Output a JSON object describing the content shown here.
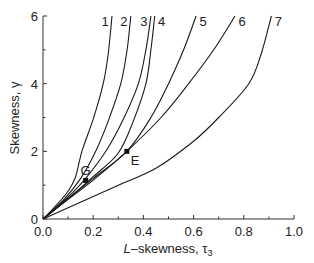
{
  "chart_data": {
    "type": "line",
    "title": "",
    "xlabel": "L-skewness, τ3",
    "xlabel_italic_prefix": "L",
    "xlabel_rest": "–skewness, τ",
    "xlabel_sub": "3",
    "ylabel": "Skewness, γ",
    "xlim": [
      0.0,
      1.0
    ],
    "ylim": [
      0,
      6
    ],
    "grid": false,
    "legend": "none; curves labeled 1–7 at top end",
    "x_ticks": [
      "0.0",
      "0.2",
      "0.4",
      "0.6",
      "0.8",
      "1.0"
    ],
    "x_tick_values": [
      0.0,
      0.2,
      0.4,
      0.6,
      0.8,
      1.0
    ],
    "x_minor_ticks": [
      0.1,
      0.3,
      0.5,
      0.7,
      0.9
    ],
    "y_ticks": [
      "0",
      "2",
      "4",
      "6"
    ],
    "y_tick_values": [
      0,
      2,
      4,
      6
    ],
    "y_minor_ticks": [
      1,
      3,
      5
    ],
    "series": [
      {
        "name": "1",
        "label": "1",
        "points": [
          [
            0,
            0
          ],
          [
            0.05,
            0.38
          ],
          [
            0.1,
            0.82
          ],
          [
            0.13,
            1.25
          ],
          [
            0.155,
            2.0
          ],
          [
            0.2,
            2.95
          ],
          [
            0.24,
            4.0
          ],
          [
            0.26,
            4.9
          ],
          [
            0.275,
            6.0
          ]
        ]
      },
      {
        "name": "2",
        "label": "2",
        "points": [
          [
            0,
            0
          ],
          [
            0.08,
            0.55
          ],
          [
            0.15,
            1.2
          ],
          [
            0.21,
            2.0
          ],
          [
            0.26,
            2.9
          ],
          [
            0.31,
            4.0
          ],
          [
            0.335,
            5.0
          ],
          [
            0.35,
            6.0
          ]
        ]
      },
      {
        "name": "3",
        "label": "3",
        "points": [
          [
            0,
            0
          ],
          [
            0.1,
            0.65
          ],
          [
            0.17,
            1.2
          ],
          [
            0.25,
            2.0
          ],
          [
            0.32,
            2.95
          ],
          [
            0.38,
            4.0
          ],
          [
            0.41,
            5.0
          ],
          [
            0.43,
            6.0
          ]
        ]
      },
      {
        "name": "4",
        "label": "4",
        "points": [
          [
            0,
            0
          ],
          [
            0.1,
            0.6
          ],
          [
            0.2,
            1.25
          ],
          [
            0.3,
            1.95
          ],
          [
            0.36,
            2.9
          ],
          [
            0.41,
            4.0
          ],
          [
            0.43,
            5.0
          ],
          [
            0.445,
            6.0
          ]
        ]
      },
      {
        "name": "5",
        "label": "5",
        "points": [
          [
            0,
            0
          ],
          [
            0.1,
            0.6
          ],
          [
            0.2,
            1.2
          ],
          [
            0.334,
            2.0
          ],
          [
            0.43,
            3.0
          ],
          [
            0.5,
            4.0
          ],
          [
            0.56,
            5.0
          ],
          [
            0.61,
            6.0
          ]
        ]
      },
      {
        "name": "6",
        "label": "6",
        "points": [
          [
            0,
            0
          ],
          [
            0.1,
            0.58
          ],
          [
            0.2,
            1.15
          ],
          [
            0.334,
            2.0
          ],
          [
            0.47,
            3.0
          ],
          [
            0.58,
            4.0
          ],
          [
            0.68,
            5.0
          ],
          [
            0.765,
            6.0
          ]
        ]
      },
      {
        "name": "7",
        "label": "7",
        "points": [
          [
            0,
            0
          ],
          [
            0.1,
            0.33
          ],
          [
            0.3,
            1.0
          ],
          [
            0.45,
            1.5
          ],
          [
            0.6,
            2.3
          ],
          [
            0.7,
            3.0
          ],
          [
            0.82,
            4.0
          ],
          [
            0.87,
            4.9
          ],
          [
            0.91,
            6.0
          ]
        ]
      }
    ],
    "markers": [
      {
        "name": "G",
        "label": "G",
        "x": 0.17,
        "y": 1.14
      },
      {
        "name": "E",
        "label": "E",
        "x": 0.334,
        "y": 2.0
      }
    ],
    "color": "#1a1a1a"
  }
}
